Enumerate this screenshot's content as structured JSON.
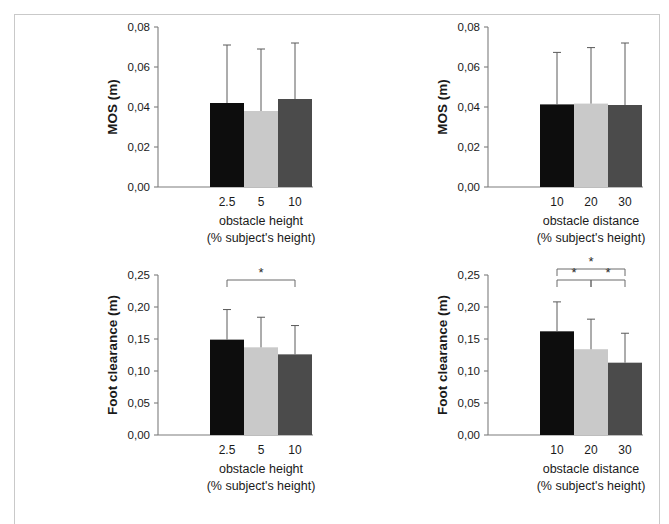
{
  "figure": {
    "name": "obstacle-crossing-bar-figure",
    "background": "#ffffff",
    "frame_color": "#c9c9c9",
    "bar_colors": {
      "series1": "#0d0d0d",
      "series2": "#c9c9c9",
      "series3": "#4b4b4b"
    },
    "significance_marker": "*"
  },
  "chart_data": [
    {
      "id": "mos-obstacle-height",
      "panel": "top-left",
      "type": "bar",
      "title": "",
      "xlabel": "obstacle height",
      "xlabel_sub": "(% subject's height)",
      "ylabel": "MOS (m)",
      "categories": [
        "2.5",
        "5",
        "10"
      ],
      "values": [
        0.042,
        0.038,
        0.044
      ],
      "errors": [
        0.029,
        0.031,
        0.028
      ],
      "ylim": [
        0.0,
        0.08
      ],
      "yticks": [
        0.0,
        0.02,
        0.04,
        0.06,
        0.08
      ],
      "ytick_labels": [
        "0,00",
        "0,02",
        "0,04",
        "0,06",
        "0,08"
      ],
      "grid": false,
      "legend": "none",
      "significance": []
    },
    {
      "id": "mos-obstacle-distance",
      "panel": "top-right",
      "type": "bar",
      "title": "",
      "xlabel": "obstacle distance",
      "xlabel_sub": "(% subject's height)",
      "ylabel": "MOS (m)",
      "categories": [
        "10",
        "20",
        "30"
      ],
      "values": [
        0.0413,
        0.0417,
        0.041
      ],
      "errors": [
        0.026,
        0.028,
        0.031
      ],
      "ylim": [
        0.0,
        0.08
      ],
      "yticks": [
        0.0,
        0.02,
        0.04,
        0.06,
        0.08
      ],
      "ytick_labels": [
        "0,00",
        "0,02",
        "0,04",
        "0,06",
        "0,08"
      ],
      "grid": false,
      "legend": "none",
      "significance": []
    },
    {
      "id": "foot-clearance-obstacle-height",
      "panel": "bottom-left",
      "type": "bar",
      "title": "",
      "xlabel": "obstacle height",
      "xlabel_sub": "(% subject's height)",
      "ylabel": "Foot clearance (m)",
      "categories": [
        "2.5",
        "5",
        "10"
      ],
      "values": [
        0.149,
        0.137,
        0.126
      ],
      "errors": [
        0.047,
        0.047,
        0.045
      ],
      "ylim": [
        0.0,
        0.25
      ],
      "yticks": [
        0.0,
        0.05,
        0.1,
        0.15,
        0.2,
        0.25
      ],
      "ytick_labels": [
        "0,00",
        "0,05",
        "0,10",
        "0,15",
        "0,20",
        "0,25"
      ],
      "grid": false,
      "legend": "none",
      "significance": [
        {
          "from": 0,
          "to": 2,
          "marker": "*",
          "level": 0
        }
      ]
    },
    {
      "id": "foot-clearance-obstacle-distance",
      "panel": "bottom-right",
      "type": "bar",
      "title": "",
      "xlabel": "obstacle distance",
      "xlabel_sub": "(% subject's height)",
      "ylabel": "Foot clearance (m)",
      "categories": [
        "10",
        "20",
        "30"
      ],
      "values": [
        0.162,
        0.134,
        0.113
      ],
      "errors": [
        0.046,
        0.047,
        0.046
      ],
      "ylim": [
        0.0,
        0.25
      ],
      "yticks": [
        0.0,
        0.05,
        0.1,
        0.15,
        0.2,
        0.25
      ],
      "ytick_labels": [
        "0,00",
        "0,05",
        "0,10",
        "0,15",
        "0,20",
        "0,25"
      ],
      "grid": false,
      "legend": "none",
      "significance": [
        {
          "from": 0,
          "to": 2,
          "marker": "*",
          "level": 1
        },
        {
          "from": 0,
          "to": 1,
          "marker": "*",
          "level": 0
        },
        {
          "from": 1,
          "to": 2,
          "marker": "*",
          "level": 0
        }
      ]
    }
  ]
}
